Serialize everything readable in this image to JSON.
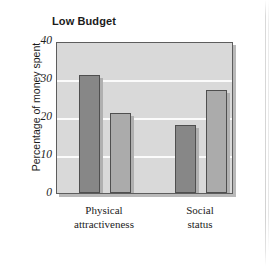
{
  "figure": {
    "title": "Low Budget"
  },
  "chart_data": {
    "type": "bar",
    "title": "Low Budget",
    "xlabel": "",
    "ylabel": "Percentage of money spent",
    "ylim": [
      0,
      40
    ],
    "yticks": [
      "0",
      "10",
      "20",
      "30",
      "40"
    ],
    "ytick_values": [
      0,
      10,
      20,
      30,
      40
    ],
    "grid": true,
    "legend": "none",
    "categories": [
      "Physical attractiveness",
      "Social status"
    ],
    "category_lines": [
      [
        "Physical",
        "attractiveness"
      ],
      [
        "Social",
        "status"
      ]
    ],
    "series": [
      {
        "name": "series-1",
        "color": "#878787",
        "values": [
          31,
          18
        ]
      },
      {
        "name": "series-2",
        "color": "#ababab",
        "values": [
          21,
          27
        ]
      }
    ],
    "bars": [
      {
        "category": "Physical attractiveness",
        "series": "series-1",
        "value": 31
      },
      {
        "category": "Physical attractiveness",
        "series": "series-2",
        "value": 21
      },
      {
        "category": "Social status",
        "series": "series-1",
        "value": 18
      },
      {
        "category": "Social status",
        "series": "series-2",
        "value": 27
      }
    ]
  },
  "colors": {
    "bar_dark": "#878787",
    "bar_light": "#ababab",
    "plot_background": "#d9d9d9",
    "gridline": "#fbfbfb",
    "axis": "#5d5d5d",
    "text": "#1b1b1b"
  }
}
